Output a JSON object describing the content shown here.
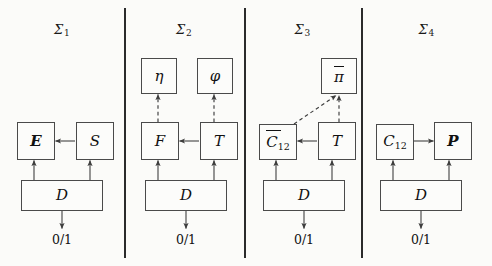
{
  "figure": {
    "background": "#fbfbf9",
    "line_color": "#4a4a4a",
    "text_color": "#111111",
    "width": 492,
    "height": 266
  },
  "panels": [
    {
      "id": "sigma-1",
      "title_base": "Σ",
      "title_sub": "1",
      "io_label": "0/1",
      "nodes": [
        {
          "id": "E",
          "label": "E",
          "style": "bold"
        },
        {
          "id": "S",
          "label": "𝒜",
          "label_text": "S",
          "style": "cal"
        },
        {
          "id": "D",
          "label": "D",
          "style": "cal"
        }
      ]
    },
    {
      "id": "sigma-2",
      "title_base": "Σ",
      "title_sub": "2",
      "io_label": "0/1",
      "nodes": [
        {
          "id": "eta",
          "label": "η",
          "style": "greek"
        },
        {
          "id": "phi",
          "label": "φ",
          "style": "greek"
        },
        {
          "id": "F",
          "label": "F",
          "style": "cal"
        },
        {
          "id": "T",
          "label": "T",
          "style": "cal"
        },
        {
          "id": "D",
          "label": "D",
          "style": "cal"
        }
      ]
    },
    {
      "id": "sigma-3",
      "title_base": "Σ",
      "title_sub": "3",
      "io_label": "0/1",
      "nodes": [
        {
          "id": "pi",
          "label": "π",
          "style": "greek",
          "overbar": true
        },
        {
          "id": "C12bar",
          "label": "C",
          "sub": "12",
          "style": "cal",
          "overbar": true
        },
        {
          "id": "T",
          "label": "T",
          "style": "cal"
        },
        {
          "id": "D",
          "label": "D",
          "style": "cal"
        }
      ]
    },
    {
      "id": "sigma-4",
      "title_base": "Σ",
      "title_sub": "4",
      "io_label": "0/1",
      "nodes": [
        {
          "id": "C12",
          "label": "C",
          "sub": "12",
          "style": "cal"
        },
        {
          "id": "P",
          "label": "P",
          "style": "bold"
        },
        {
          "id": "D",
          "label": "D",
          "style": "cal"
        }
      ]
    }
  ],
  "labels": {
    "sigma1_title": "Σ",
    "sigma1_sub": "1",
    "sigma2_title": "Σ",
    "sigma2_sub": "2",
    "sigma3_title": "Σ",
    "sigma3_sub": "3",
    "sigma4_title": "Σ",
    "sigma4_sub": "4",
    "io": "0/1",
    "E": "E",
    "S": "S",
    "D": "D",
    "eta": "η",
    "phi": "φ",
    "F": "F",
    "T": "T",
    "pi": "π",
    "Cbar": "C",
    "Cbar_sub": "12",
    "C": "C",
    "C_sub": "12",
    "P": "P"
  }
}
